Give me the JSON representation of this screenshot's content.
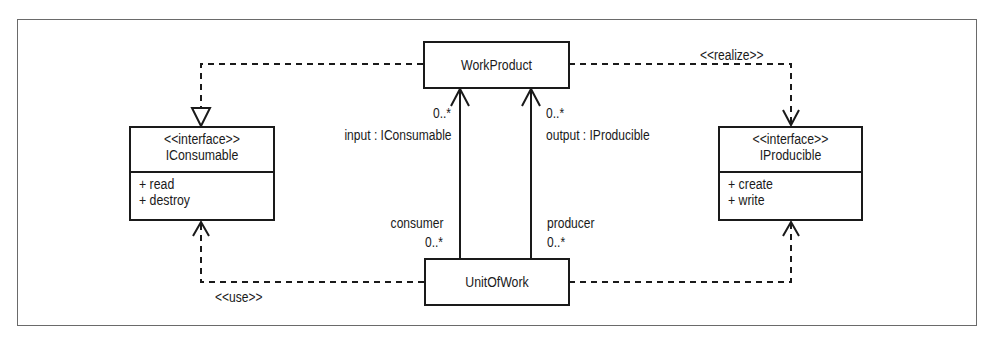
{
  "diagram": {
    "type": "UML class diagram",
    "classes": {
      "work_product": {
        "name": "WorkProduct"
      },
      "unit_of_work": {
        "name": "UnitOfWork"
      },
      "iconsumable": {
        "stereotype": "<<interface>>",
        "name": "IConsumable",
        "operations": [
          "+ read",
          "+ destroy"
        ]
      },
      "iproducible": {
        "stereotype": "<<interface>>",
        "name": "IProducible",
        "operations": [
          "+ create",
          "+ write"
        ]
      }
    },
    "relationships": {
      "wp_to_iconsumable": {
        "kind": "realization",
        "from": "WorkProduct",
        "to": "IConsumable",
        "label": ""
      },
      "wp_to_iproducible": {
        "kind": "dependency",
        "from": "WorkProduct",
        "to": "IProducible",
        "label": "<<realize>>"
      },
      "uow_to_iconsumable": {
        "kind": "dependency",
        "from": "UnitOfWork",
        "to": "IConsumable",
        "label": "<<use>>"
      },
      "uow_to_iproducible": {
        "kind": "dependency",
        "from": "UnitOfWork",
        "to": "IProducible",
        "label": ""
      },
      "input_assoc": {
        "kind": "association",
        "from": "UnitOfWork",
        "to": "WorkProduct",
        "target_multiplicity": "0..*",
        "target_role": "input : IConsumable",
        "source_role": "consumer",
        "source_multiplicity": "0..*"
      },
      "output_assoc": {
        "kind": "association",
        "from": "UnitOfWork",
        "to": "WorkProduct",
        "target_multiplicity": "0..*",
        "target_role": "output : IProducible",
        "source_role": "producer",
        "source_multiplicity": "0..*"
      }
    },
    "colors": {
      "line": "#1a1a1a",
      "frame": "#6a6a6a",
      "background": "#ffffff"
    }
  }
}
